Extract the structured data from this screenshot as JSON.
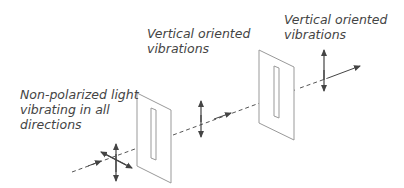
{
  "labels": {
    "unpolarized": [
      "Non-polarized light",
      "vibrating in all",
      "directions"
    ],
    "after_first": [
      "Vertical oriented",
      "vibrations"
    ],
    "after_second": [
      "Vertical oriented",
      "vibrations"
    ]
  },
  "colors": {
    "line": "#444444",
    "polarizer": "#999999",
    "text": "#444444"
  }
}
